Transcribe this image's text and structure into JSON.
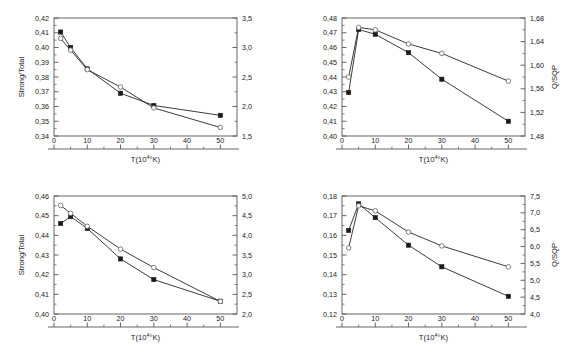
{
  "figure": {
    "panel_count": 4,
    "x_axis_label": "T(10",
    "x_axis_label_sup": "4",
    "x_axis_label_tail": "°K)",
    "series_marker_filled": "filled-square",
    "series_marker_open": "open-circle",
    "line_color": "#1a1a1a",
    "frame_color": "#555555"
  },
  "chart_data": [
    {
      "id": "top-left",
      "type": "line",
      "title": "",
      "xlabel": "T(10⁴°K)",
      "ylabel": "Strong/Total",
      "ylabel_right": "",
      "xlim": [
        0,
        55
      ],
      "ylim": [
        0.34,
        0.42
      ],
      "ylim_right": [
        1.5,
        3.5
      ],
      "xticks": [
        0,
        10,
        20,
        30,
        40,
        50
      ],
      "xticklabels": [
        "0",
        "10",
        "20",
        "30",
        "40",
        "50"
      ],
      "yticks": [
        0.34,
        0.35,
        0.36,
        0.37,
        0.38,
        0.39,
        0.4,
        0.41,
        0.42
      ],
      "yticklabels": [
        "0,34",
        "0,35",
        "0,36",
        "0,37",
        "0,38",
        "0,39",
        "0,40",
        "0,41",
        "0,42"
      ],
      "yticks_right": [
        1.5,
        2.0,
        2.5,
        3.0,
        3.5
      ],
      "yticklabels_right": [
        "1,5",
        "2,0",
        "2,5",
        "3,0",
        "3,5"
      ],
      "grid": false,
      "legend": false,
      "x": [
        2,
        5,
        10,
        20,
        30,
        50
      ],
      "series": [
        {
          "name": "Strong/Total",
          "marker": "filled-square",
          "axis": "left",
          "values": [
            0.4105,
            0.4,
            0.3855,
            0.369,
            0.3607,
            0.354
          ]
        },
        {
          "name": "Q/SQP",
          "marker": "open-circle",
          "axis": "right",
          "values": [
            3.155,
            2.955,
            2.625,
            2.33,
            1.975,
            1.645
          ]
        }
      ]
    },
    {
      "id": "top-right",
      "type": "line",
      "title": "",
      "xlabel": "T(10⁴°K)",
      "ylabel": "",
      "ylabel_right": "Q/SQP",
      "xlim": [
        0,
        55
      ],
      "ylim": [
        0.4,
        0.48
      ],
      "ylim_right": [
        1.48,
        1.68
      ],
      "xticks": [
        0,
        10,
        20,
        30,
        40,
        50
      ],
      "xticklabels": [
        "0",
        "10",
        "20",
        "30",
        "40",
        "50"
      ],
      "yticks": [
        0.4,
        0.41,
        0.42,
        0.43,
        0.44,
        0.45,
        0.46,
        0.47,
        0.48
      ],
      "yticklabels": [
        "0,40",
        "0,41",
        "0,42",
        "0,43",
        "0,44",
        "0,45",
        "0,46",
        "0,47",
        "0,48"
      ],
      "yticks_right": [
        1.48,
        1.52,
        1.56,
        1.6,
        1.64,
        1.68
      ],
      "yticklabels_right": [
        "1,48",
        "1,52",
        "1,56",
        "1,60",
        "1,64",
        "1,68"
      ],
      "grid": false,
      "legend": false,
      "x": [
        2,
        5,
        10,
        20,
        30,
        50
      ],
      "series": [
        {
          "name": "Strong/Total",
          "marker": "filled-square",
          "axis": "left",
          "values": [
            0.4295,
            0.4722,
            0.469,
            0.4565,
            0.4385,
            0.41
          ]
        },
        {
          "name": "Q/SQP",
          "marker": "open-circle",
          "axis": "right",
          "values": [
            1.58,
            1.664,
            1.66,
            1.636,
            1.62,
            1.573
          ]
        }
      ]
    },
    {
      "id": "bottom-left",
      "type": "line",
      "title": "",
      "xlabel": "T(10⁴°K)",
      "ylabel": "Strong/Total",
      "ylabel_right": "",
      "xlim": [
        0,
        55
      ],
      "ylim": [
        0.4,
        0.46
      ],
      "ylim_right": [
        2.0,
        5.0
      ],
      "xticks": [
        0,
        10,
        20,
        30,
        40,
        50
      ],
      "xticklabels": [
        "0",
        "10",
        "20",
        "30",
        "40",
        "50"
      ],
      "yticks": [
        0.4,
        0.41,
        0.42,
        0.43,
        0.44,
        0.45,
        0.46
      ],
      "yticklabels": [
        "0,40",
        "0,41",
        "0,42",
        "0,43",
        "0,44",
        "0,45",
        "0,46"
      ],
      "yticks_right": [
        2.0,
        2.5,
        3.0,
        3.5,
        4.0,
        4.5,
        5.0
      ],
      "yticklabels_right": [
        "2,0",
        "2,5",
        "3,0",
        "3,5",
        "4,0",
        "4,5",
        "5,0"
      ],
      "grid": false,
      "legend": false,
      "x": [
        2,
        5,
        10,
        20,
        30,
        50
      ],
      "series": [
        {
          "name": "Strong/Total",
          "marker": "filled-square",
          "axis": "left",
          "values": [
            0.446,
            0.4495,
            0.4435,
            0.428,
            0.4175,
            0.4065
          ]
        },
        {
          "name": "Q/SQP",
          "marker": "open-circle",
          "axis": "right",
          "values": [
            4.76,
            4.56,
            4.23,
            3.65,
            3.18,
            2.32
          ]
        }
      ]
    },
    {
      "id": "bottom-right",
      "type": "line",
      "title": "",
      "xlabel": "T(10⁴°K)",
      "ylabel": "",
      "ylabel_right": "Q/SQP",
      "xlim": [
        0,
        55
      ],
      "ylim": [
        0.12,
        0.18
      ],
      "ylim_right": [
        4.0,
        7.5
      ],
      "xticks": [
        0,
        10,
        20,
        30,
        40,
        50
      ],
      "xticklabels": [
        "0",
        "10",
        "20",
        "30",
        "40",
        "50"
      ],
      "yticks": [
        0.12,
        0.13,
        0.14,
        0.15,
        0.16,
        0.17,
        0.18
      ],
      "yticklabels": [
        "0,12",
        "0,13",
        "0,14",
        "0,15",
        "0,16",
        "0,17",
        "0,18"
      ],
      "yticks_right": [
        4.0,
        4.5,
        5.0,
        5.5,
        6.0,
        6.5,
        7.0,
        7.5
      ],
      "yticklabels_right": [
        "4,0",
        "4,5",
        "5,0",
        "5,5",
        "6,0",
        "6,5",
        "7,0",
        "7,5"
      ],
      "grid": false,
      "legend": false,
      "x": [
        2,
        5,
        10,
        20,
        30,
        50
      ],
      "series": [
        {
          "name": "Strong/Total",
          "marker": "filled-square",
          "axis": "left",
          "values": [
            0.1625,
            0.176,
            0.169,
            0.155,
            0.144,
            0.129
          ]
        },
        {
          "name": "Q/SQP",
          "marker": "open-circle",
          "axis": "right",
          "values": [
            5.96,
            7.21,
            7.06,
            6.43,
            6.02,
            5.4
          ]
        }
      ]
    }
  ]
}
